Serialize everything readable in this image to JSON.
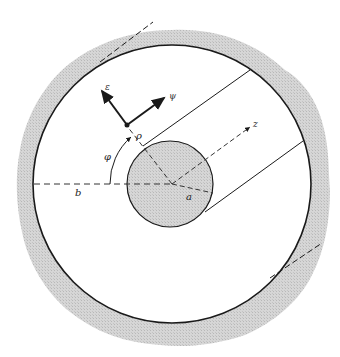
{
  "figure": {
    "colors": {
      "background": "#ffffff",
      "shade": "#cfcfcf",
      "line": "#1a1a1a"
    },
    "labels": {
      "outer_radius": "b",
      "inner_radius": "a",
      "radial_coordinate": "ρ",
      "angle": "φ",
      "axis": "z",
      "unit_vector_phi": "ε",
      "unit_vector_rho": "ψ"
    }
  }
}
